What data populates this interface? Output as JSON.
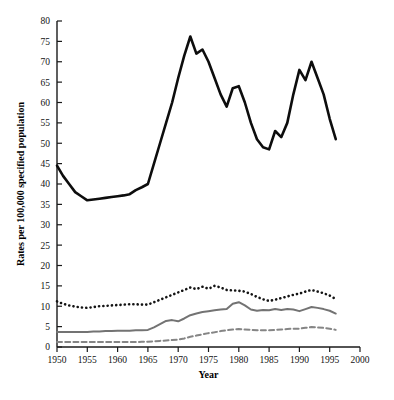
{
  "figure": {
    "background": "#ffffff",
    "caption_faint": ""
  },
  "chart_data": {
    "type": "line",
    "title": "",
    "xlabel": "Year",
    "ylabel": "Rates per 100,000 specified population",
    "xlim": [
      1950,
      2000
    ],
    "ylim": [
      0,
      80
    ],
    "xticks": [
      1950,
      1955,
      1960,
      1965,
      1970,
      1975,
      1980,
      1985,
      1990,
      1995,
      2000
    ],
    "yticks": [
      0,
      5,
      10,
      15,
      20,
      25,
      30,
      35,
      40,
      45,
      50,
      55,
      60,
      65,
      70,
      75,
      80
    ],
    "grid": false,
    "legend": "none",
    "x": [
      1950,
      1951,
      1952,
      1953,
      1954,
      1955,
      1956,
      1957,
      1958,
      1959,
      1960,
      1961,
      1962,
      1963,
      1964,
      1965,
      1966,
      1967,
      1968,
      1969,
      1970,
      1971,
      1972,
      1973,
      1974,
      1975,
      1976,
      1977,
      1978,
      1979,
      1980,
      1981,
      1982,
      1983,
      1984,
      1985,
      1986,
      1987,
      1988,
      1989,
      1990,
      1991,
      1992,
      1993,
      1994,
      1995,
      1996
    ],
    "series": [
      {
        "name": "series-thick-black",
        "style": "solid",
        "color": "#0d0d0d",
        "width": 2.6,
        "values": [
          44.5,
          42.0,
          40.0,
          38.0,
          37.0,
          36.0,
          36.2,
          36.4,
          36.6,
          36.8,
          37.0,
          37.2,
          37.5,
          38.5,
          39.2,
          40.0,
          45.0,
          50.0,
          55.0,
          60.0,
          66.0,
          71.5,
          76.2,
          72.0,
          73.0,
          70.0,
          66.0,
          62.0,
          59.0,
          63.5,
          64.0,
          60.0,
          55.0,
          51.0,
          49.0,
          48.5,
          53.0,
          51.5,
          55.0,
          62.0,
          68.0,
          65.5,
          70.0,
          66.0,
          62.0,
          56.0,
          51.0
        ]
      },
      {
        "name": "series-dotted-black",
        "style": "dotted",
        "color": "#141414",
        "width": 2.2,
        "values": [
          11.2,
          10.6,
          10.2,
          9.9,
          9.7,
          9.6,
          9.8,
          10.0,
          10.1,
          10.2,
          10.3,
          10.4,
          10.5,
          10.5,
          10.4,
          10.4,
          11.0,
          11.6,
          12.2,
          12.8,
          13.4,
          14.0,
          14.6,
          14.2,
          14.8,
          14.3,
          15.0,
          14.6,
          14.0,
          13.9,
          13.8,
          13.6,
          13.0,
          12.3,
          11.7,
          11.3,
          11.6,
          12.0,
          12.4,
          12.8,
          13.1,
          13.6,
          14.0,
          13.6,
          13.2,
          12.6,
          11.8
        ]
      },
      {
        "name": "series-solid-gray",
        "style": "solid",
        "color": "#737373",
        "width": 2.0,
        "values": [
          3.7,
          3.7,
          3.7,
          3.7,
          3.7,
          3.7,
          3.8,
          3.8,
          3.9,
          3.9,
          4.0,
          4.0,
          4.0,
          4.1,
          4.1,
          4.2,
          4.8,
          5.6,
          6.4,
          6.6,
          6.3,
          7.0,
          7.8,
          8.2,
          8.6,
          8.8,
          9.0,
          9.2,
          9.3,
          10.6,
          11.0,
          10.2,
          9.2,
          8.9,
          9.1,
          9.0,
          9.3,
          9.1,
          9.3,
          9.2,
          8.8,
          9.3,
          9.8,
          9.6,
          9.3,
          8.9,
          8.2
        ]
      },
      {
        "name": "series-dashed-gray",
        "style": "dashed",
        "color": "#858585",
        "width": 2.0,
        "values": [
          1.2,
          1.2,
          1.2,
          1.2,
          1.2,
          1.2,
          1.2,
          1.2,
          1.2,
          1.2,
          1.2,
          1.2,
          1.2,
          1.2,
          1.3,
          1.3,
          1.4,
          1.5,
          1.6,
          1.7,
          1.8,
          2.1,
          2.5,
          2.8,
          3.1,
          3.4,
          3.6,
          3.9,
          4.1,
          4.3,
          4.4,
          4.3,
          4.2,
          4.1,
          4.1,
          4.1,
          4.2,
          4.3,
          4.4,
          4.5,
          4.5,
          4.7,
          4.9,
          4.8,
          4.7,
          4.5,
          4.2
        ]
      }
    ]
  }
}
